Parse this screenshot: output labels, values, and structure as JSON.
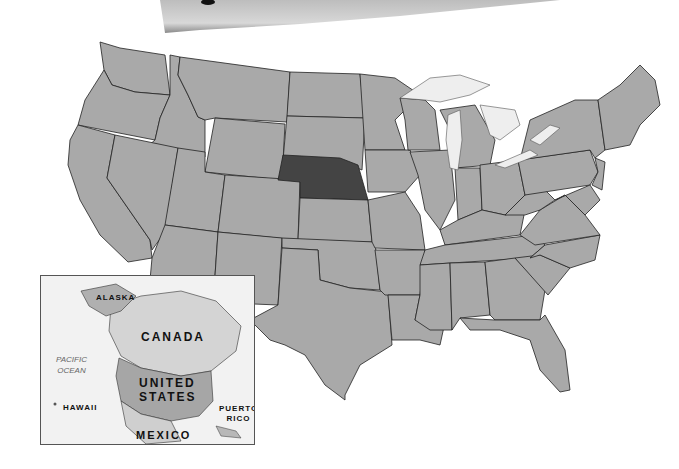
{
  "map": {
    "title": "United States with Nebraska highlighted",
    "highlighted_state": "Nebraska",
    "colors": {
      "state_fill": "#a9a9a9",
      "highlight_fill": "#444444",
      "lake_fill": "#eeeeee",
      "border": "#222222",
      "background": "#ffffff"
    }
  },
  "inset": {
    "labels": {
      "alaska": "ALASKA",
      "canada": "CANADA",
      "pacific": "PACIFIC",
      "ocean": "OCEAN",
      "united": "UNITED",
      "states": "STATES",
      "hawaii": "HAWAII",
      "puerto": "PUERTO",
      "rico": "RICO",
      "mexico": "MEXICO"
    },
    "colors": {
      "ocean": "#f2f2f2",
      "canada": "#d4d4d4",
      "us": "#a6a6a6",
      "mexico": "#cfcfcf"
    }
  }
}
